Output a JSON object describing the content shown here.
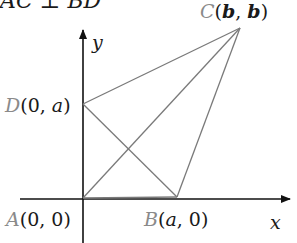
{
  "header": {
    "partial_text": "AC ⊥ BD"
  },
  "axes": {
    "x_label": "x",
    "y_label": "y"
  },
  "points": {
    "A": {
      "name": "A",
      "coords": "(0, 0)"
    },
    "B": {
      "name": "B",
      "coords_open": "(",
      "coords_var": "a",
      "coords_close": ", 0)"
    },
    "C": {
      "name": "C",
      "coords_open": "(",
      "coords_var1": "b",
      "coords_sep": ", ",
      "coords_var2": "b",
      "coords_close": ")"
    },
    "D": {
      "name": "D",
      "coords_open": "(0, ",
      "coords_var": "a",
      "coords_close": ")"
    }
  },
  "colors": {
    "axis": "#111111",
    "segment": "#7a7a7a",
    "point_label": "#8a8a8a"
  }
}
